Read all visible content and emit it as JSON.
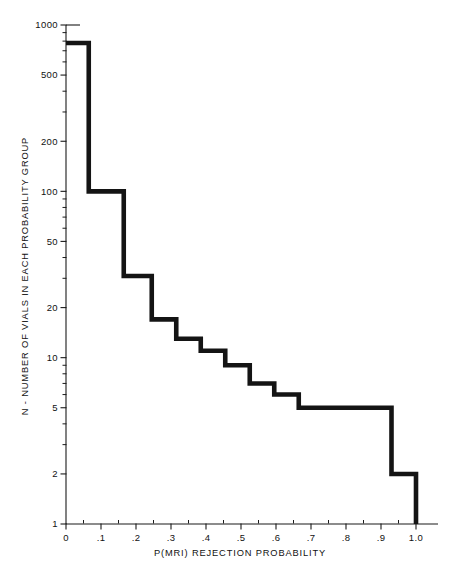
{
  "chart_data": {
    "type": "line",
    "subtype": "step-histogram",
    "title": "",
    "xlabel": "P(MRI) REJECTION PROBABILITY",
    "ylabel": "N - NUMBER OF VIALS IN EACH PROBABILITY GROUP",
    "xscale": "linear",
    "yscale": "log",
    "xlim": [
      0,
      1.05
    ],
    "ylim": [
      1,
      1000
    ],
    "grid": false,
    "legend": null,
    "x_ticks": [
      0,
      0.1,
      0.2,
      0.3,
      0.4,
      0.5,
      0.6,
      0.7,
      0.8,
      0.9,
      1.0
    ],
    "x_tick_labels": [
      "0",
      ".1",
      ".2",
      ".3",
      ".4",
      ".5",
      ".6",
      ".7",
      ".8",
      ".9",
      "1.0"
    ],
    "x_minor_ticks": [
      0.05,
      0.15,
      0.25,
      0.35,
      0.45,
      0.55,
      0.65,
      0.75,
      0.85,
      0.95
    ],
    "y_ticks": [
      1,
      2,
      5,
      10,
      20,
      50,
      100,
      200,
      500,
      1000
    ],
    "y_tick_labels": [
      "1",
      "2",
      "5",
      "10",
      "20",
      "50",
      "100",
      "200",
      "500",
      "1000"
    ],
    "y_minor_ticks": [
      3,
      4,
      6,
      7,
      8,
      9,
      30,
      40,
      60,
      70,
      80,
      90,
      300,
      400,
      600,
      700,
      800,
      900
    ],
    "bin_edges": [
      0.0,
      0.065,
      0.165,
      0.245,
      0.315,
      0.385,
      0.455,
      0.525,
      0.595,
      0.665,
      0.755,
      0.93,
      1.0
    ],
    "bin_values": [
      780,
      100,
      31,
      31,
      17,
      17,
      11,
      11,
      7,
      5,
      5,
      2
    ],
    "steps": [
      {
        "x_start": 0.0,
        "x_end": 0.065,
        "value": 780
      },
      {
        "x_start": 0.065,
        "x_end": 0.165,
        "value": 100
      },
      {
        "x_start": 0.165,
        "x_end": 0.245,
        "value": 31
      },
      {
        "x_start": 0.245,
        "x_end": 0.315,
        "value": 17
      },
      {
        "x_start": 0.315,
        "x_end": 0.385,
        "value": 13
      },
      {
        "x_start": 0.385,
        "x_end": 0.455,
        "value": 11
      },
      {
        "x_start": 0.455,
        "x_end": 0.525,
        "value": 9
      },
      {
        "x_start": 0.525,
        "x_end": 0.595,
        "value": 7
      },
      {
        "x_start": 0.595,
        "x_end": 0.665,
        "value": 6
      },
      {
        "x_start": 0.665,
        "x_end": 0.755,
        "value": 5
      },
      {
        "x_start": 0.755,
        "x_end": 0.93,
        "value": 5
      },
      {
        "x_start": 0.93,
        "x_end": 1.0,
        "value": 2
      },
      {
        "x_start": 1.0,
        "x_end": 1.0,
        "value": 1
      }
    ],
    "colors": {
      "curve": "#141414",
      "axis": "#1a1a1a",
      "background": "#ffffff"
    }
  }
}
